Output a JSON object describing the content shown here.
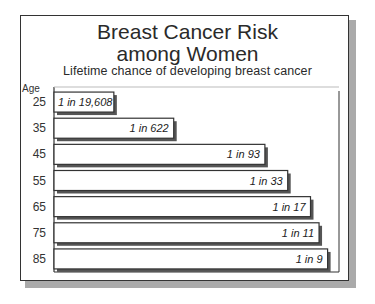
{
  "chart_data": {
    "type": "bar",
    "orientation": "horizontal",
    "title_lines": [
      "Breast Cancer Risk",
      "among Women"
    ],
    "subtitle": "Lifetime chance of developing breast cancer",
    "ylabel": "Age",
    "xlabel": "",
    "categories": [
      "25",
      "35",
      "45",
      "55",
      "65",
      "75",
      "85"
    ],
    "labels": [
      "1 in 19,608",
      "1 in 622",
      "1 in 93",
      "1 in 33",
      "1 in 17",
      "1 in 11",
      "1 in 9"
    ],
    "risk_one_in": [
      19608,
      622,
      93,
      33,
      17,
      11,
      9
    ],
    "bar_extent_fraction": [
      0.21,
      0.42,
      0.74,
      0.82,
      0.9,
      0.93,
      0.96
    ],
    "grid": false,
    "legend": "none"
  }
}
